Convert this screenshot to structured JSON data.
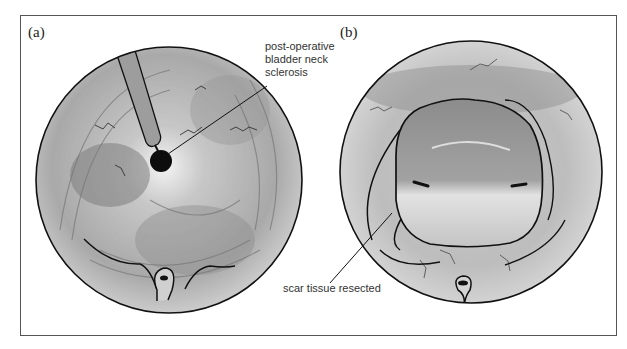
{
  "figure": {
    "panels": [
      {
        "label": "(a)",
        "annotation_lines": [
          "post-operative",
          "bladder neck",
          "sclerosis"
        ]
      },
      {
        "label": "(b)",
        "annotation_lines": [
          "scar tissue resected"
        ]
      }
    ]
  },
  "colors": {
    "outline": "#111111",
    "tissue_light": "#e6e6e6",
    "tissue_mid": "#b4b4b4",
    "tissue_dark": "#8a8a8a",
    "frame": "#555555"
  }
}
